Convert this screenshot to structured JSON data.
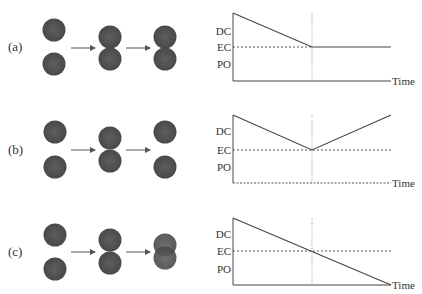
{
  "figure": {
    "panels": [
      {
        "label": "(a)",
        "spheres": [
          [
            [
              54,
              30
            ],
            [
              54,
              64
            ]
          ],
          [
            [
              110,
              37
            ],
            [
              110,
              59
            ]
          ],
          [
            [
              165,
              37
            ],
            [
              165,
              59
            ]
          ]
        ],
        "axis_labels": {
          "top": "DC",
          "mid": "EC",
          "bottom": "PO",
          "x": "Time"
        },
        "chart": {
          "y_top": 13,
          "y_ec": 47,
          "y_bottom": 81,
          "curve": [
            [
              233,
              13
            ],
            [
              312,
              47
            ],
            [
              391,
              47
            ]
          ]
        }
      },
      {
        "label": "(b)",
        "spheres": [
          [
            [
              55,
              132
            ],
            [
              55,
              167
            ]
          ],
          [
            [
              110,
              138
            ],
            [
              110,
              161
            ]
          ],
          [
            [
              165,
              132
            ],
            [
              165,
              167
            ]
          ]
        ],
        "axis_labels": {
          "top": "DC",
          "mid": "EC",
          "bottom": "PO",
          "x": "Time"
        },
        "chart": {
          "y_top": 115,
          "y_ec": 150,
          "y_bottom": 183,
          "curve": [
            [
              233,
              115
            ],
            [
              312,
              150
            ],
            [
              391,
              115
            ]
          ]
        }
      },
      {
        "label": "(c)",
        "spheres": [
          [
            [
              55,
              235
            ],
            [
              55,
              269
            ]
          ],
          [
            [
              110,
              240
            ],
            [
              110,
              263
            ]
          ],
          [
            [
              165,
              245
            ],
            [
              165,
              258
            ]
          ]
        ],
        "axis_labels": {
          "top": "DC",
          "mid": "EC",
          "bottom": "PO",
          "x": "Time"
        },
        "chart": {
          "y_top": 218,
          "y_ec": 251,
          "y_bottom": 285,
          "curve": [
            [
              233,
              218
            ],
            [
              312,
              251
            ],
            [
              391,
              285
            ]
          ]
        }
      }
    ],
    "colors": {
      "sphere": "#555555",
      "line": "#444444",
      "dashed": "#555555",
      "text": "#333333"
    }
  }
}
